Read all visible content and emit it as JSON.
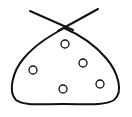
{
  "figure": {
    "stroke_color": "#111111",
    "background": "#ffffff",
    "width": 132,
    "height": 117
  },
  "tie": {
    "left_line": {
      "x1": 30,
      "y1": 11,
      "x2": 73,
      "y2": 30
    },
    "right_line": {
      "x1": 98,
      "y1": 9,
      "x2": 58,
      "y2": 31
    }
  },
  "circles": [
    {
      "cx": 65,
      "cy": 44,
      "r": 4
    },
    {
      "cx": 83,
      "cy": 63,
      "r": 4
    },
    {
      "cx": 33,
      "cy": 70,
      "r": 4
    },
    {
      "cx": 63,
      "cy": 89,
      "r": 4
    },
    {
      "cx": 100,
      "cy": 84,
      "r": 4
    }
  ]
}
